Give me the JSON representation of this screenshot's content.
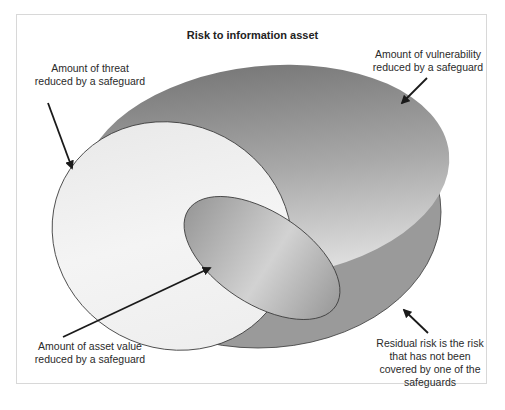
{
  "diagram": {
    "title": "Risk to information asset",
    "colors": {
      "base_risk": "#9a9a9a",
      "vulnerability_top": "#7e7e7e",
      "vulnerability_bottom": "#dedede",
      "threat_light": "#f2f2f2",
      "asset_mid": "#b5b5b5",
      "outline": "#333333",
      "arrow": "#1a1a1a"
    },
    "regions": [
      {
        "id": "risk",
        "label": "Risk to information asset"
      },
      {
        "id": "vulnerability",
        "label": "Amount of vulnerability reduced by a safeguard"
      },
      {
        "id": "threat",
        "label": "Amount of threat reduced by a safeguard"
      },
      {
        "id": "asset-value",
        "label": "Amount of asset value reduced by a safeguard"
      },
      {
        "id": "residual",
        "label": "Residual risk is the risk that has not been covered by one of the safeguards"
      }
    ],
    "labels": {
      "threat": [
        "Amount of threat",
        "reduced by a safeguard"
      ],
      "vulnerability": [
        "Amount of vulnerability",
        "reduced by a safeguard"
      ],
      "asset_value": [
        "Amount of asset value",
        "reduced by a safeguard"
      ],
      "residual": [
        "Residual risk is the risk",
        "that has not been",
        "covered by one of the",
        "safeguards"
      ]
    }
  }
}
